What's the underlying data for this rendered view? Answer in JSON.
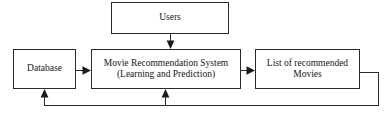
{
  "diagram": {
    "type": "block-flow-diagram",
    "stroke_color": "#2a2a2a",
    "background_color": "#ffffff",
    "nodes": [
      {
        "id": "users",
        "label": "Users",
        "sublabel": ""
      },
      {
        "id": "database",
        "label": "Database",
        "sublabel": ""
      },
      {
        "id": "system",
        "label": "Movie Recommendation System",
        "sublabel": "(Learning and Prediction)"
      },
      {
        "id": "output",
        "label": "List of recommended",
        "sublabel": "Movies"
      }
    ],
    "edges": [
      {
        "id": "users-to-system",
        "from": "users",
        "to": "system",
        "label": "",
        "direction": "down"
      },
      {
        "id": "database-to-system",
        "from": "database",
        "to": "system",
        "label": "",
        "direction": "right"
      },
      {
        "id": "system-to-output",
        "from": "system",
        "to": "output",
        "label": "",
        "direction": "right"
      },
      {
        "id": "output-to-database-feedback",
        "from": "output",
        "to": "database",
        "label": "",
        "direction": "feedback-up"
      },
      {
        "id": "output-to-system-feedback",
        "from": "output",
        "to": "system",
        "label": "",
        "direction": "feedback-up"
      }
    ]
  }
}
